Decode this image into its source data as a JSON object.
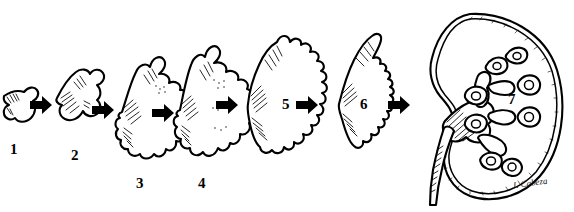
{
  "figure": {
    "background_color": "#ffffff",
    "ink_color": "#000000",
    "signature": "J. Cabeza"
  },
  "stages": [
    {
      "number": "1",
      "name": "ureteric-bud",
      "description": "Small ureteric bud with ampulla",
      "label_x": 10,
      "label_y": 142
    },
    {
      "number": "2",
      "name": "first-branching",
      "description": "Bud divided into early lobes",
      "label_x": 71,
      "label_y": 148
    },
    {
      "number": "3",
      "name": "branching-generations",
      "description": "Repeated dichotomous branching",
      "label_x": 136,
      "label_y": 176
    },
    {
      "number": "4",
      "name": "expanded-branching",
      "description": "Further generations of branching",
      "label_x": 198,
      "label_y": 176
    },
    {
      "number": "5",
      "name": "lobulated-mass",
      "description": "Coalesced lobulated renal mass",
      "label_x": 282,
      "label_y": 112
    },
    {
      "number": "6",
      "name": "crescent-pelvis",
      "description": "Crescent pelvis with serrated calyces",
      "label_x": 360,
      "label_y": 112
    },
    {
      "number": "7",
      "name": "calyceal-system",
      "description": "Mature calyces within definitive kidney",
      "label_x": 508,
      "label_y": 104
    }
  ],
  "arrows": [
    {
      "name": "arrow-1-to-2",
      "x": 30,
      "y": 105
    },
    {
      "name": "arrow-2-to-3",
      "x": 92,
      "y": 110
    },
    {
      "name": "arrow-3-to-4",
      "x": 152,
      "y": 113
    },
    {
      "name": "arrow-4-to-5",
      "x": 216,
      "y": 105
    },
    {
      "name": "arrow-5-to-6",
      "x": 296,
      "y": 105
    },
    {
      "name": "arrow-6-to-7",
      "x": 388,
      "y": 105
    }
  ],
  "kidney": {
    "name": "definitive-kidney",
    "features": [
      "renal-capsule",
      "renal-pelvis",
      "major-calyces",
      "minor-calyces",
      "ureter"
    ]
  }
}
